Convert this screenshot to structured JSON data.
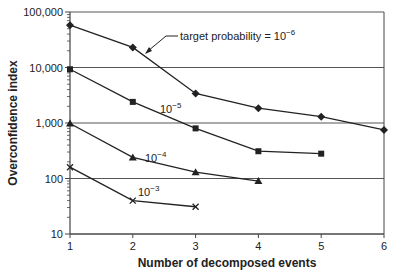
{
  "chart_data": {
    "type": "line",
    "title": "",
    "xlabel": "Number of decomposed events",
    "ylabel": "Overconfidence index",
    "yscale": "log",
    "ylim": [
      10,
      100000
    ],
    "xlim": [
      1,
      6
    ],
    "x_ticks": [
      "1",
      "2",
      "3",
      "4",
      "5",
      "6"
    ],
    "y_ticks": [
      "10",
      "100",
      "1,000",
      "10,000",
      "100,000"
    ],
    "grid": "horizontal major gridlines at each decade",
    "legend": "none (series labelled inline)",
    "series": [
      {
        "name": "target probability = 10^-6",
        "label_text": "target probability = 10",
        "label_exp": "−6",
        "marker": "diamond",
        "x": [
          1,
          2,
          3,
          4,
          5,
          6
        ],
        "values": [
          58000,
          23000,
          3400,
          1850,
          1300,
          750
        ]
      },
      {
        "name": "10^-5",
        "label_text": "10",
        "label_exp": "−5",
        "marker": "square",
        "x": [
          1,
          2,
          3,
          4,
          5
        ],
        "values": [
          9300,
          2400,
          800,
          310,
          280
        ]
      },
      {
        "name": "10^-4",
        "label_text": "10",
        "label_exp": "−4",
        "marker": "triangle",
        "x": [
          1,
          2,
          3,
          4
        ],
        "values": [
          980,
          240,
          130,
          90
        ]
      },
      {
        "name": "10^-3",
        "label_text": "10",
        "label_exp": "−3",
        "marker": "x",
        "x": [
          1,
          2,
          3
        ],
        "values": [
          160,
          40,
          31
        ]
      }
    ],
    "colors": {
      "line": "#222222",
      "grid": "#555555",
      "axis": "#444444"
    }
  }
}
